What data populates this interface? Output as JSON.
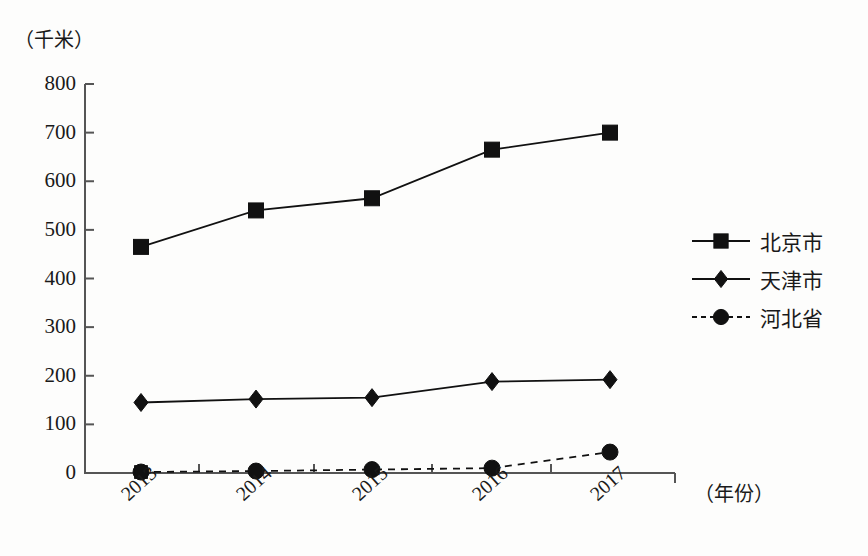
{
  "chart_data": {
    "type": "line",
    "title": "",
    "xlabel": "（年份）",
    "ylabel": "（千米）",
    "categories": [
      "2013",
      "2014",
      "2015",
      "2016",
      "2017"
    ],
    "ylim": [
      0,
      800
    ],
    "yticks": [
      "0",
      "100",
      "200",
      "300",
      "400",
      "500",
      "600",
      "700",
      "800"
    ],
    "ytick_values": [
      0,
      100,
      200,
      300,
      400,
      500,
      600,
      700,
      800
    ],
    "grid": false,
    "legend_position": "right",
    "series": [
      {
        "name": "北京市",
        "marker": "square",
        "line_style": "solid",
        "color": "#111111",
        "values": [
          465,
          540,
          565,
          665,
          700
        ]
      },
      {
        "name": "天津市",
        "marker": "diamond",
        "line_style": "solid",
        "color": "#111111",
        "values": [
          145,
          152,
          155,
          188,
          192
        ]
      },
      {
        "name": "河北省",
        "marker": "circle",
        "line_style": "dashed",
        "color": "#111111",
        "values": [
          2,
          4,
          7,
          10,
          43
        ]
      }
    ]
  },
  "axis": {
    "y_unit_caption": "（千米）",
    "x_unit_caption": "（年份）"
  },
  "legend": {
    "items": [
      {
        "label": "北京市",
        "marker": "square-marker",
        "line_style": "solid"
      },
      {
        "label": "天津市",
        "marker": "diamond-marker",
        "line_style": "solid"
      },
      {
        "label": "河北省",
        "marker": "circle-marker",
        "line_style": "dashed"
      }
    ]
  }
}
